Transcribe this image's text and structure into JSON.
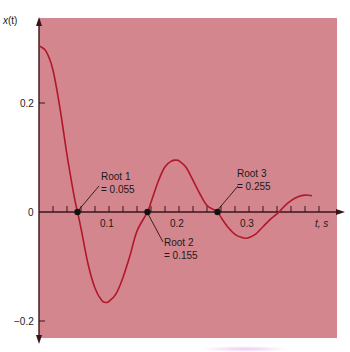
{
  "chart_data": {
    "type": "line",
    "title": "",
    "xlabel": "t, s",
    "ylabel": "x(t)",
    "xlim": [
      0,
      0.43
    ],
    "ylim": [
      -0.23,
      0.35
    ],
    "x_ticks": [
      0.1,
      0.2,
      0.3
    ],
    "x_tick_labels": [
      "0.1",
      "0.2",
      "0.3"
    ],
    "x_minor_tick_step": 0.02,
    "y_ticks": [
      0.2,
      0,
      -0.2
    ],
    "y_tick_labels": [
      "0.2",
      "0",
      "−0.2"
    ],
    "grid": false,
    "legend": null,
    "series": [
      {
        "name": "x(t)",
        "color": "#b0182a",
        "x": [
          0,
          0.01,
          0.02,
          0.03,
          0.04,
          0.05,
          0.055,
          0.06,
          0.07,
          0.08,
          0.09,
          0.096,
          0.1,
          0.11,
          0.12,
          0.13,
          0.14,
          0.155,
          0.16,
          0.17,
          0.18,
          0.19,
          0.196,
          0.2,
          0.21,
          0.22,
          0.23,
          0.24,
          0.255,
          0.26,
          0.27,
          0.28,
          0.29,
          0.296,
          0.3,
          0.31,
          0.32,
          0.33,
          0.343,
          0.35,
          0.36,
          0.37,
          0.38,
          0.39
        ],
        "y": [
          0.305,
          0.295,
          0.26,
          0.19,
          0.105,
          0.03,
          0.0,
          -0.03,
          -0.095,
          -0.14,
          -0.163,
          -0.166,
          -0.164,
          -0.15,
          -0.12,
          -0.08,
          -0.035,
          0.0,
          0.018,
          0.055,
          0.083,
          0.094,
          0.095,
          0.094,
          0.082,
          0.058,
          0.033,
          0.012,
          0.0,
          -0.01,
          -0.028,
          -0.041,
          -0.047,
          -0.048,
          -0.047,
          -0.04,
          -0.027,
          -0.014,
          0.0,
          0.01,
          0.021,
          0.028,
          0.031,
          0.03
        ]
      }
    ],
    "annotations": [
      {
        "label_line1": "Root 1",
        "label_line2": "= 0.055",
        "x": 0.055,
        "y": 0
      },
      {
        "label_line1": "Root 2",
        "label_line2": "= 0.155",
        "x": 0.155,
        "y": 0
      },
      {
        "label_line1": "Root 3",
        "label_line2": "= 0.255",
        "x": 0.255,
        "y": 0
      }
    ],
    "background_color": "#d4868f",
    "axis_color": "#3a1418"
  },
  "labels": {
    "ylabel_x": "x",
    "ylabel_paren": "(t)",
    "xlabel": "t, s",
    "ytick_02": "0.2",
    "ytick_0": "0",
    "ytick_m02": "−0.2",
    "xtick_01": "0.1",
    "xtick_02": "0.2",
    "xtick_03": "0.3",
    "root1_l1": "Root 1",
    "root1_l2": "= 0.055",
    "root2_l1": "Root 2",
    "root2_l2": "= 0.155",
    "root3_l1": "Root 3",
    "root3_l2": "= 0.255"
  }
}
